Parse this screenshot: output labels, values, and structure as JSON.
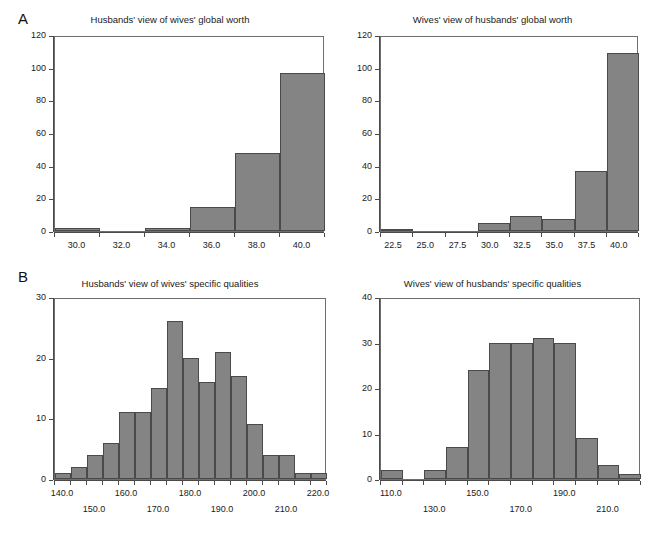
{
  "figure": {
    "panels": [
      {
        "letter": "A"
      },
      {
        "letter": "B"
      }
    ]
  },
  "chart_data": [
    {
      "id": "husbands-global-worth",
      "type": "bar",
      "title": "Husbands' view of wives' global worth",
      "xlabel": "",
      "ylabel": "",
      "ylim": [
        0,
        120
      ],
      "yticks": [
        0,
        20,
        40,
        60,
        80,
        100,
        120
      ],
      "ytick_labels": [
        "0",
        "20",
        "40",
        "60",
        "80",
        "100",
        "120"
      ],
      "xlim": [
        29,
        41
      ],
      "xticks": [
        30.0,
        32.0,
        34.0,
        36.0,
        38.0,
        40.0
      ],
      "xtick_labels": [
        "30.0",
        "32.0",
        "34.0",
        "36.0",
        "38.0",
        "40.0"
      ],
      "bin_edges": [
        29,
        31,
        33,
        35,
        37,
        39,
        41
      ],
      "values": [
        2,
        0,
        2,
        15,
        48,
        97
      ],
      "grid": false,
      "legend": "none"
    },
    {
      "id": "wives-global-worth",
      "type": "bar",
      "title": "Wives' view of husbands' global worth",
      "xlabel": "",
      "ylabel": "",
      "ylim": [
        0,
        120
      ],
      "yticks": [
        0,
        20,
        40,
        60,
        80,
        100,
        120
      ],
      "ytick_labels": [
        "0",
        "20",
        "40",
        "60",
        "80",
        "100",
        "120"
      ],
      "xlim": [
        21.5,
        41.5
      ],
      "xticks": [
        22.5,
        25.0,
        27.5,
        30.0,
        32.5,
        35.0,
        37.5,
        40.0
      ],
      "xtick_labels": [
        "22.5",
        "25.0",
        "27.5",
        "30.0",
        "32.5",
        "35.0",
        "37.5",
        "40.0"
      ],
      "bin_edges": [
        21.5,
        24.0,
        26.5,
        29.0,
        31.5,
        34.0,
        36.5,
        39.0,
        41.5
      ],
      "values": [
        1,
        0,
        0,
        5,
        9,
        7.5,
        37,
        109
      ],
      "grid": false,
      "legend": "none"
    },
    {
      "id": "husbands-specific-qualities",
      "type": "bar",
      "title": "Husbands' view of wives' specific qualities",
      "xlabel": "",
      "ylabel": "",
      "ylim": [
        0,
        30
      ],
      "yticks": [
        0,
        10,
        20,
        30
      ],
      "ytick_labels": [
        "0",
        "10",
        "20",
        "30"
      ],
      "xlim": [
        137.5,
        222.5
      ],
      "xticks": [
        140.0,
        150.0,
        160.0,
        170.0,
        180.0,
        190.0,
        200.0,
        210.0,
        220.0
      ],
      "xtick_labels": [
        "140.0",
        "150.0",
        "160.0",
        "170.0",
        "180.0",
        "190.0",
        "200.0",
        "210.0",
        "220.0"
      ],
      "bin_edges": [
        137.5,
        142.5,
        147.5,
        152.5,
        157.5,
        162.5,
        167.5,
        172.5,
        177.5,
        182.5,
        187.5,
        192.5,
        197.5,
        202.5,
        207.5,
        212.5,
        217.5,
        222.5
      ],
      "values": [
        1,
        2,
        4,
        6,
        11,
        11,
        15,
        26,
        20,
        16,
        21,
        17,
        9,
        4,
        4,
        1,
        1
      ],
      "grid": false,
      "legend": "none"
    },
    {
      "id": "wives-specific-qualities",
      "type": "bar",
      "title": "Wives' view of husbands' specific qualities",
      "xlabel": "",
      "ylabel": "",
      "ylim": [
        0,
        40
      ],
      "yticks": [
        0,
        10,
        20,
        30,
        40
      ],
      "ytick_labels": [
        "0",
        "10",
        "20",
        "30",
        "40"
      ],
      "xlim": [
        105,
        225
      ],
      "xticks": [
        110.0,
        130.0,
        150.0,
        170.0,
        190.0,
        210.0
      ],
      "xtick_labels": [
        "110.0",
        "130.0",
        "150.0",
        "170.0",
        "190.0",
        "210.0"
      ],
      "bin_edges": [
        105,
        115,
        125,
        135,
        145,
        155,
        165,
        175,
        185,
        195,
        205,
        215,
        225
      ],
      "values": [
        2,
        0,
        2,
        7,
        24,
        30,
        30,
        31,
        30,
        9,
        3,
        1
      ],
      "grid": false,
      "legend": "none"
    }
  ],
  "colors": {
    "bar_fill": "#848484",
    "bar_stroke": "#4a4a4a",
    "frame": "#6e6e6e",
    "text": "#1a1a1a",
    "background": "#ffffff"
  }
}
